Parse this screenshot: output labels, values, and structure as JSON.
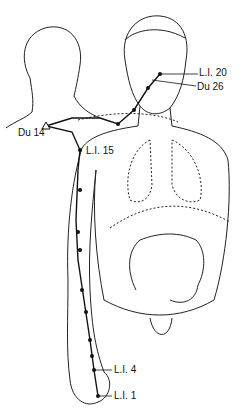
{
  "diagram": {
    "labels": {
      "li20": "L.I. 20",
      "du26": "Du 26",
      "du14": "Du 14",
      "li15": "L.I. 15",
      "li4": "L.I. 4",
      "li1": "L.I. 1"
    },
    "colors": {
      "line": "#222222",
      "point": "#111111",
      "background": "#ffffff"
    }
  }
}
